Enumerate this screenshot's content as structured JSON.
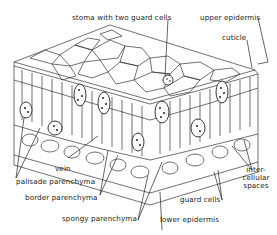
{
  "diagram": {
    "labels": {
      "stoma": "stoma with two guard cells",
      "upper_epidermis": "upper epidermis",
      "cuticle": "cuticle",
      "vein": "vein",
      "palisade": "palisade parenchyma",
      "border": "border parenchyma",
      "spongy": "spongy parenchyma",
      "lower_epidermis": "lower epidermis",
      "guard_cells": "guard cells",
      "intercellular_1": "inter-",
      "intercellular_2": "cellular",
      "intercellular_3": "spaces"
    },
    "colors": {
      "line": "#222222",
      "background": "#ffffff"
    }
  }
}
